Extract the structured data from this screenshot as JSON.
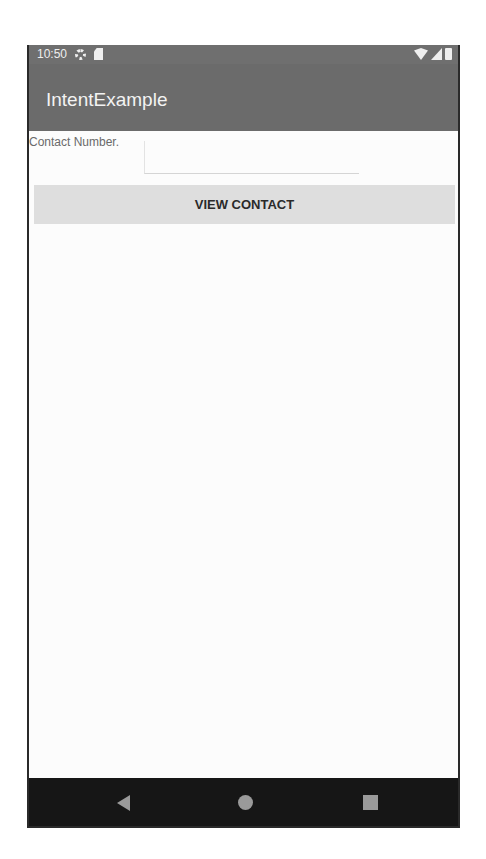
{
  "status_bar": {
    "time": "10:50",
    "left_icons": [
      "gear-icon",
      "sdcard-icon"
    ],
    "right_icons": [
      "wifi-icon",
      "signal-icon",
      "battery-icon"
    ]
  },
  "app_bar": {
    "title": "IntentExample"
  },
  "form": {
    "contact_label": "Contact Number.",
    "contact_input_value": "",
    "contact_input_placeholder": "",
    "view_button_label": "VIEW CONTACT"
  },
  "nav_bar": {
    "buttons": [
      "back",
      "home",
      "recents"
    ]
  },
  "colors": {
    "app_bar": "#6b6b6b",
    "status_bar": "#6f6f6f",
    "nav_bar": "#161616",
    "button": "#dedede"
  }
}
